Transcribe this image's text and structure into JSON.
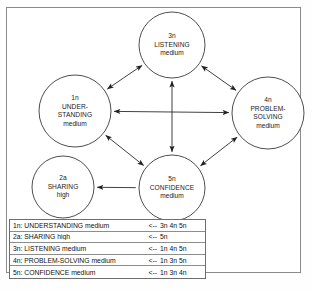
{
  "diagram": {
    "frame": {
      "border_color": "#8a8a8a"
    },
    "nodes": [
      {
        "id": "1n",
        "code": "1n",
        "name_lines": [
          "UNDER-",
          "STANDING"
        ],
        "name": "UNDERSTANDING",
        "level": "medium",
        "cx": 75,
        "cy": 111,
        "r": 36
      },
      {
        "id": "2a",
        "code": "2a",
        "name_lines": [
          "SHARING"
        ],
        "name": "SHARING",
        "level": "high",
        "cx": 63,
        "cy": 187,
        "r": 31
      },
      {
        "id": "3n",
        "code": "3n",
        "name_lines": [
          "LISTENING"
        ],
        "name": "LISTENING",
        "level": "medium",
        "cx": 172,
        "cy": 45,
        "r": 33
      },
      {
        "id": "4n",
        "code": "4n",
        "name_lines": [
          "PROBLEM-",
          "SOLVING"
        ],
        "name": "PROBLEM-SOLVING",
        "level": "medium",
        "cx": 268,
        "cy": 113,
        "r": 36
      },
      {
        "id": "5n",
        "code": "5n",
        "name_lines": [
          "CONFIDENCE"
        ],
        "name": "CONFIDENCE",
        "level": "medium",
        "cx": 172,
        "cy": 188,
        "r": 33
      }
    ],
    "edges": [
      {
        "from": "1n",
        "to": "3n",
        "direction": "both",
        "name": "edge-understanding-listening"
      },
      {
        "from": "3n",
        "to": "4n",
        "direction": "both",
        "name": "edge-listening-problem-solving"
      },
      {
        "from": "1n",
        "to": "4n",
        "direction": "both",
        "name": "edge-understanding-problem-solving"
      },
      {
        "from": "3n",
        "to": "5n",
        "direction": "both",
        "name": "edge-listening-confidence"
      },
      {
        "from": "1n",
        "to": "5n",
        "direction": "both",
        "name": "edge-understanding-confidence"
      },
      {
        "from": "5n",
        "to": "4n",
        "direction": "both",
        "name": "edge-confidence-problem-solving"
      },
      {
        "from": "5n",
        "to": "2a",
        "direction": "to",
        "name": "edge-confidence-sharing"
      }
    ],
    "stroke_color": "#2b2b2b",
    "node_stroke": "#3a3a3a"
  },
  "legend": {
    "name": "legend-table",
    "arrow": "<--",
    "rows": [
      {
        "label": "1n: UNDERSTANDING medium",
        "arrow": "<--",
        "sources": "3n 4n 5n"
      },
      {
        "label": "2a: SHARING high",
        "arrow": "<--",
        "sources": "5n"
      },
      {
        "label": "3n: LISTENING medium",
        "arrow": "<--",
        "sources": "1n 4n 5n"
      },
      {
        "label": "4n: PROBLEM-SOLVING medium",
        "arrow": "<--",
        "sources": "1n 3n 5n"
      },
      {
        "label": "5n: CONFIDENCE medium",
        "arrow": "<--",
        "sources": "1n 3n 4n"
      }
    ]
  }
}
